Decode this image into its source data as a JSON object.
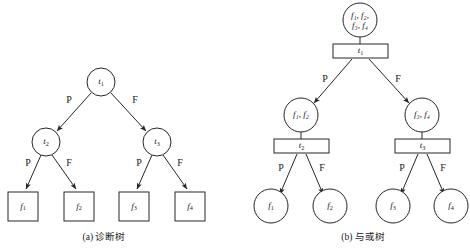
{
  "figure": {
    "background": "#ffffff",
    "stroke_color": "#262626",
    "text_color": "#1a1a1a",
    "panels": [
      {
        "id": "panel-a",
        "caption": "(a) 诊断树",
        "caption_x": 104,
        "caption_y": 238,
        "nodes": [
          {
            "name": "node-t1",
            "shape": "circle",
            "cx": 101,
            "cy": 82,
            "r": 14,
            "main": "t",
            "sub": "1",
            "lines": 1
          },
          {
            "name": "node-t2",
            "shape": "circle",
            "cx": 46,
            "cy": 142,
            "r": 14,
            "main": "t",
            "sub": "2",
            "lines": 1
          },
          {
            "name": "node-t3",
            "shape": "circle",
            "cx": 157,
            "cy": 142,
            "r": 14,
            "main": "t",
            "sub": "3",
            "lines": 1
          },
          {
            "name": "node-f1",
            "shape": "rect",
            "x": 8,
            "y": 192,
            "w": 30,
            "h": 29,
            "main": "f",
            "sub": "1",
            "lines": 1
          },
          {
            "name": "node-f2",
            "shape": "rect",
            "x": 64,
            "y": 192,
            "w": 30,
            "h": 29,
            "main": "f",
            "sub": "2",
            "lines": 1
          },
          {
            "name": "node-f3",
            "shape": "rect",
            "x": 119,
            "y": 192,
            "w": 30,
            "h": 29,
            "main": "f",
            "sub": "3",
            "lines": 1
          },
          {
            "name": "node-f4",
            "shape": "rect",
            "x": 175,
            "y": 192,
            "w": 30,
            "h": 29,
            "main": "f",
            "sub": "4",
            "lines": 1
          }
        ],
        "edges": [
          {
            "name": "edge-t1-t2",
            "x1": 91,
            "y1": 93,
            "x2": 57,
            "y2": 131,
            "label": "P",
            "lx": 69,
            "ly": 101
          },
          {
            "name": "edge-t1-t3",
            "x1": 111,
            "y1": 93,
            "x2": 146,
            "y2": 131,
            "label": "F",
            "lx": 135,
            "ly": 101
          },
          {
            "name": "edge-t2-f1",
            "x1": 41,
            "y1": 155,
            "x2": 26,
            "y2": 189,
            "label": "P",
            "lx": 28,
            "ly": 164
          },
          {
            "name": "edge-t2-f2",
            "x1": 52,
            "y1": 155,
            "x2": 76,
            "y2": 189,
            "label": "F",
            "lx": 69,
            "ly": 164
          },
          {
            "name": "edge-t3-f3",
            "x1": 152,
            "y1": 155,
            "x2": 137,
            "y2": 189,
            "label": "P",
            "lx": 139,
            "ly": 164
          },
          {
            "name": "edge-t3-f4",
            "x1": 163,
            "y1": 155,
            "x2": 187,
            "y2": 189,
            "label": "F",
            "lx": 180,
            "ly": 164
          }
        ],
        "connectors": []
      },
      {
        "id": "panel-b",
        "caption": "(b) 与或树",
        "caption_x": 363,
        "caption_y": 238,
        "nodes": [
          {
            "name": "node-root-faults",
            "shape": "circle",
            "cx": 360,
            "cy": 20,
            "r": 17,
            "line1": "f₁, f₂,",
            "line2": "f₃, f₄",
            "lines": 2
          },
          {
            "name": "node-test-t1",
            "shape": "rect",
            "x": 333,
            "y": 44,
            "w": 55,
            "h": 14,
            "main": "t",
            "sub": "1",
            "lines": 1
          },
          {
            "name": "node-faults-12",
            "shape": "circle",
            "cx": 301,
            "cy": 115,
            "r": 17,
            "line1": "f₁, f₂",
            "lines": 1
          },
          {
            "name": "node-test-t2",
            "shape": "rect",
            "x": 274,
            "y": 139,
            "w": 55,
            "h": 14,
            "main": "t",
            "sub": "2",
            "lines": 1
          },
          {
            "name": "node-faults-34",
            "shape": "circle",
            "cx": 422,
            "cy": 115,
            "r": 17,
            "line1": "f₃, f₄",
            "lines": 1
          },
          {
            "name": "node-test-t3",
            "shape": "rect",
            "x": 395,
            "y": 139,
            "w": 55,
            "h": 14,
            "main": "t",
            "sub": "3",
            "lines": 1
          },
          {
            "name": "node-leaf-f1",
            "shape": "circle",
            "cx": 271,
            "cy": 206,
            "r": 17,
            "main": "f",
            "sub": "1",
            "lines": 1
          },
          {
            "name": "node-leaf-f2",
            "shape": "circle",
            "cx": 330,
            "cy": 206,
            "r": 17,
            "main": "f",
            "sub": "2",
            "lines": 1
          },
          {
            "name": "node-leaf-f3",
            "shape": "circle",
            "cx": 393,
            "cy": 206,
            "r": 17,
            "main": "f",
            "sub": "3",
            "lines": 1
          },
          {
            "name": "node-leaf-f4",
            "shape": "circle",
            "cx": 451,
            "cy": 206,
            "r": 17,
            "main": "f",
            "sub": "4",
            "lines": 1
          }
        ],
        "edges": [
          {
            "name": "edge-t1-faults12",
            "x1": 352,
            "y1": 59,
            "x2": 314,
            "y2": 103,
            "label": "P",
            "lx": 325,
            "ly": 80
          },
          {
            "name": "edge-t1-faults34",
            "x1": 369,
            "y1": 59,
            "x2": 409,
            "y2": 103,
            "label": "F",
            "lx": 398,
            "ly": 80
          },
          {
            "name": "edge-t2-f1",
            "x1": 297,
            "y1": 154,
            "x2": 280,
            "y2": 194,
            "label": "P",
            "lx": 281,
            "ly": 169
          },
          {
            "name": "edge-t2-f2",
            "x1": 306,
            "y1": 154,
            "x2": 323,
            "y2": 194,
            "label": "F",
            "lx": 322,
            "ly": 169
          },
          {
            "name": "edge-t3-f3",
            "x1": 418,
            "y1": 154,
            "x2": 401,
            "y2": 194,
            "label": "P",
            "lx": 402,
            "ly": 169
          },
          {
            "name": "edge-t3-f4",
            "x1": 427,
            "y1": 154,
            "x2": 444,
            "y2": 194,
            "label": "F",
            "lx": 443,
            "ly": 169
          }
        ],
        "connectors": [
          {
            "name": "connector-root-t1",
            "x1": 360,
            "y1": 37,
            "x2": 360,
            "y2": 44
          },
          {
            "name": "connector-faults12-t2",
            "x1": 301,
            "y1": 132,
            "x2": 301,
            "y2": 139
          },
          {
            "name": "connector-faults34-t3",
            "x1": 422,
            "y1": 132,
            "x2": 422,
            "y2": 139
          }
        ]
      }
    ],
    "legend": {
      "pass_label": "P",
      "fail_label": "F"
    }
  }
}
